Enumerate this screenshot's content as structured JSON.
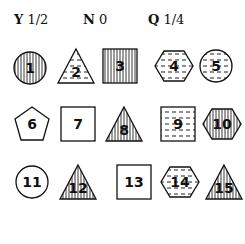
{
  "legend": [
    {
      "letter": "Y",
      "value": "1/2",
      "x": 0
    },
    {
      "letter": "N",
      "value": "0",
      "x": 69
    },
    {
      "letter": "Q",
      "value": "1/4",
      "x": 134
    }
  ],
  "shapes": [
    {
      "n": "1",
      "shape": "circle",
      "fill": "vertical",
      "x": 10,
      "y": 48
    },
    {
      "n": "2",
      "shape": "triangle",
      "fill": "dashes",
      "x": 56,
      "y": 46
    },
    {
      "n": "3",
      "shape": "square",
      "fill": "vertical",
      "x": 100,
      "y": 46
    },
    {
      "n": "4",
      "shape": "hexagon",
      "fill": "dashes",
      "x": 154,
      "y": 46
    },
    {
      "n": "5",
      "shape": "circle",
      "fill": "dashes",
      "x": 196,
      "y": 46
    },
    {
      "n": "6",
      "shape": "pentagon",
      "fill": "none",
      "x": 12,
      "y": 104
    },
    {
      "n": "7",
      "shape": "square",
      "fill": "none",
      "x": 58,
      "y": 104
    },
    {
      "n": "8",
      "shape": "triangle",
      "fill": "vertical",
      "x": 104,
      "y": 104
    },
    {
      "n": "9",
      "shape": "square",
      "fill": "dashes",
      "x": 158,
      "y": 104
    },
    {
      "n": "10",
      "shape": "hexagon",
      "fill": "vertical",
      "x": 202,
      "y": 104
    },
    {
      "n": "11",
      "shape": "circle",
      "fill": "none",
      "x": 12,
      "y": 162
    },
    {
      "n": "12",
      "shape": "triangle",
      "fill": "vertical",
      "x": 58,
      "y": 162
    },
    {
      "n": "13",
      "shape": "square",
      "fill": "none",
      "x": 114,
      "y": 162
    },
    {
      "n": "14",
      "shape": "hexagon",
      "fill": "dashes",
      "x": 160,
      "y": 162
    },
    {
      "n": "15",
      "shape": "triangle",
      "fill": "vertical",
      "x": 204,
      "y": 162
    }
  ]
}
